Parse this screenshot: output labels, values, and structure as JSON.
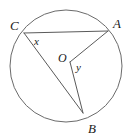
{
  "figure": {
    "name": "circle-with-inscribed-and-central-angles",
    "background_color": "#ffffff",
    "stroke_color": "#5a5a5a",
    "circle_stroke_color": "#6b6b6b",
    "label_color": "#1a1a1a"
  },
  "circle": {
    "center_x": 66,
    "center_y": 66,
    "radius": 56
  },
  "points": {
    "A": {
      "label": "A",
      "x": 108,
      "y": 31,
      "label_x": 113,
      "label_y": 28
    },
    "B": {
      "label": "B",
      "x": 83,
      "y": 113,
      "label_x": 88,
      "label_y": 133
    },
    "C": {
      "label": "C",
      "x": 24,
      "y": 33,
      "label_x": 10,
      "label_y": 30
    },
    "O": {
      "label": "O",
      "x": 70,
      "y": 62,
      "label_x": 58,
      "label_y": 62
    }
  },
  "angles": {
    "x": {
      "label": "x",
      "vertex": "C",
      "label_x": 34,
      "label_y": 45
    },
    "y": {
      "label": "y",
      "vertex": "O",
      "label_x": 76,
      "label_y": 71
    }
  },
  "segments": [
    {
      "name": "chord-CA",
      "from": "C",
      "to": "A"
    },
    {
      "name": "chord-CB",
      "from": "C",
      "to": "B"
    },
    {
      "name": "radius-OA",
      "from": "O",
      "to": "A"
    },
    {
      "name": "radius-OB",
      "from": "O",
      "to": "B"
    }
  ]
}
